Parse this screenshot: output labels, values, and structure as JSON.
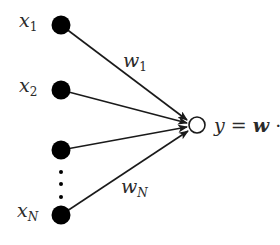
{
  "diagram": {
    "type": "perceptron",
    "inputs": [
      {
        "name": "x",
        "subscript": "1",
        "cx": 61,
        "cy": 25
      },
      {
        "name": "x",
        "subscript": "2",
        "cx": 61,
        "cy": 90
      },
      {
        "name": "",
        "subscript": "",
        "cx": 61,
        "cy": 150
      },
      {
        "name": "x",
        "subscript": "N",
        "cx": 61,
        "cy": 215
      }
    ],
    "weights": [
      {
        "name": "w",
        "subscript": "1"
      },
      {
        "name": "w",
        "subscript": "N"
      }
    ],
    "output": {
      "cx": 197,
      "cy": 125,
      "r": 8
    },
    "equation": {
      "lhs": "y",
      "equals": "=",
      "w": "w",
      "dot": "·",
      "x": "x"
    },
    "ellipsis_dots": 3,
    "colors": {
      "node_fill": "#000000",
      "line": "#1a1a1a",
      "text": "#2a2a2a",
      "background": "#ffffff"
    }
  }
}
